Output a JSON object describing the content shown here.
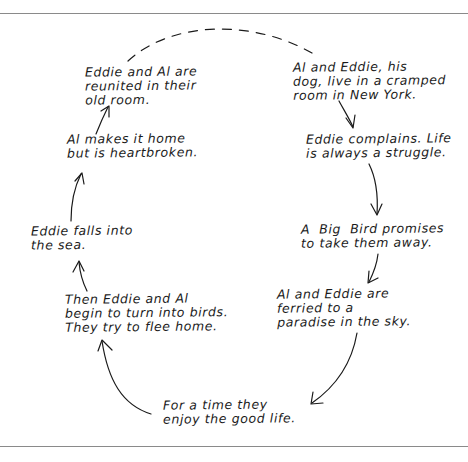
{
  "diagram": {
    "type": "cycle",
    "style": "hand-drawn",
    "nodes": [
      {
        "id": "n1",
        "lines": [
          "Al and Eddie, his",
          "dog, live in a cramped",
          "room in New York."
        ]
      },
      {
        "id": "n2",
        "lines": [
          "Eddie complains. Life",
          "is always a struggle."
        ]
      },
      {
        "id": "n3",
        "lines": [
          "A  Big  Bird promises",
          "to take them away."
        ]
      },
      {
        "id": "n4",
        "lines": [
          "Al and Eddie are",
          "ferried to a",
          "paradise in the sky."
        ]
      },
      {
        "id": "n5",
        "lines": [
          "For a time they",
          "enjoy the good life."
        ]
      },
      {
        "id": "n6",
        "lines": [
          "Then Eddie and Al",
          "begin to turn into birds.",
          "They try to flee home."
        ]
      },
      {
        "id": "n7",
        "lines": [
          "Eddie falls into",
          "the sea."
        ]
      },
      {
        "id": "n8",
        "lines": [
          "Al makes it home",
          "but is heartbroken."
        ]
      },
      {
        "id": "n9",
        "lines": [
          "Eddie and Al are",
          "reunited in their",
          "old room."
        ]
      }
    ],
    "edges": [
      {
        "from": "n1",
        "to": "n2",
        "style": "solid-arrow"
      },
      {
        "from": "n2",
        "to": "n3",
        "style": "solid-arrow"
      },
      {
        "from": "n3",
        "to": "n4",
        "style": "solid-arrow"
      },
      {
        "from": "n4",
        "to": "n5",
        "style": "solid-arrow"
      },
      {
        "from": "n5",
        "to": "n6",
        "style": "solid-arrow"
      },
      {
        "from": "n6",
        "to": "n7",
        "style": "solid-arrow"
      },
      {
        "from": "n7",
        "to": "n8",
        "style": "solid-arrow"
      },
      {
        "from": "n8",
        "to": "n9",
        "style": "solid-arrow"
      },
      {
        "from": "n9",
        "to": "n1",
        "style": "dashed-line"
      }
    ],
    "colors": {
      "ink": "#1a1a1a",
      "rule": "#8a8a8a",
      "background": "#ffffff"
    }
  }
}
